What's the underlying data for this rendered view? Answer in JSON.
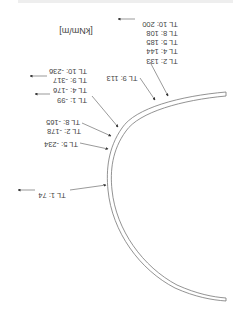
{
  "orientation": "rotated 180 degrees",
  "unit_label": "[kNm/m]",
  "top_edge_text": "",
  "labels": [
    {
      "id": "pos_tl10",
      "text": "TL 10: 200",
      "x": 160,
      "y": 20,
      "arrow": "right"
    },
    {
      "id": "pos_tl8",
      "text": "TL 8: 108",
      "x": 162,
      "y": 29
    },
    {
      "id": "pos_tl5",
      "text": "TL 5: 185",
      "x": 162,
      "y": 38
    },
    {
      "id": "pos_tl4",
      "text": "TL 4: 144",
      "x": 162,
      "y": 47
    },
    {
      "id": "pos_tl2",
      "text": "TL 2: 133",
      "x": 162,
      "y": 57
    },
    {
      "id": "pos_tl9",
      "text": "TL 9: 113",
      "x": 122,
      "y": 74
    },
    {
      "id": "neg_tl10",
      "text": "TL 10: -236",
      "x": 68,
      "y": 67
    },
    {
      "id": "neg_tl9",
      "text": "TL 9: -317",
      "x": 70,
      "y": 76,
      "arrow": "right"
    },
    {
      "id": "neg_tl4",
      "text": "TL 4: -176",
      "x": 70,
      "y": 86
    },
    {
      "id": "neg_tl1",
      "text": "TL 1: -99",
      "x": 72,
      "y": 96,
      "arrow": "right"
    },
    {
      "id": "neg_tl8",
      "text": "TL 8: -165",
      "x": 63,
      "y": 118
    },
    {
      "id": "neg_tl2",
      "text": "TL 2: -178",
      "x": 64,
      "y": 127
    },
    {
      "id": "neg_tl5",
      "text": "TL 5: -234",
      "x": 61,
      "y": 140
    },
    {
      "id": "pos_tl1",
      "text": "TL 1: 74",
      "x": 52,
      "y": 191,
      "arrow": "right"
    }
  ],
  "colors": {
    "line": "#777777",
    "text": "#444444",
    "background": "#ffffff"
  }
}
